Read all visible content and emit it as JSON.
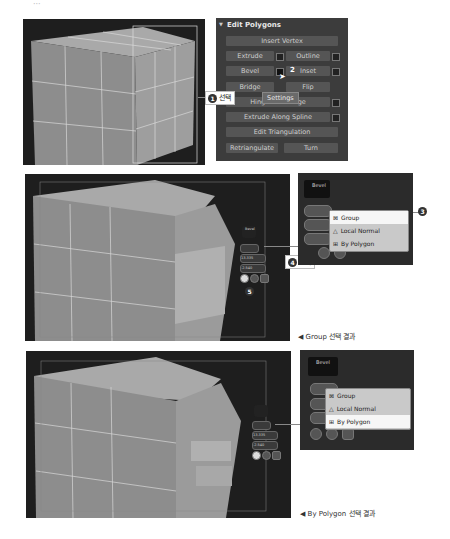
{
  "top_marker": "···",
  "edit_polygons": {
    "title": "Edit Polygons",
    "buttons": {
      "insert_vertex": "Insert Vertex",
      "extrude": "Extrude",
      "outline": "Outline",
      "bevel": "Bevel",
      "inset": "Inset",
      "bridge": "Bridge",
      "flip": "Flip",
      "hinge": "Hinge From Edge",
      "extrude_spline": "Extrude Along Spline",
      "edit_tri": "Edit Triangulation",
      "retriangulate": "Retriangulate",
      "turn": "Turn"
    },
    "tooltip": "Settings"
  },
  "callouts": {
    "c1": {
      "num": "1",
      "label": "선택"
    },
    "c2": {
      "num": "2"
    },
    "c3": {
      "num": "3"
    },
    "c4": {
      "num": "4",
      "label": "입력"
    },
    "c5": {
      "num": "5"
    }
  },
  "bevel_caddy": {
    "title": "Bevel",
    "height": "13.335",
    "outline": "-2.540",
    "mini_title": "Bevel",
    "mini_sub": "OK"
  },
  "dropdown_options": [
    "Group",
    "Local Normal",
    "By Polygon"
  ],
  "captions": {
    "group_result": "◀ Group 선택 결과",
    "polygon_result": "◀ By Polygon 선택 결과"
  },
  "colors": {
    "panel_bg": "#3c3c3c",
    "viewport_bg": "#1e1e1e",
    "cube": "#8f8f8f"
  }
}
